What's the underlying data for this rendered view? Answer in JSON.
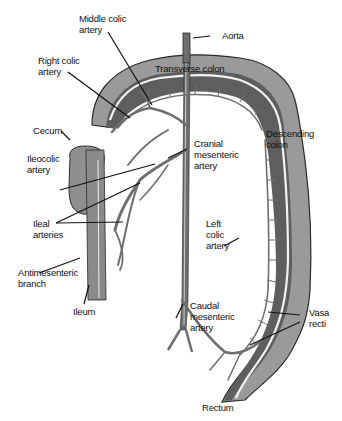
{
  "diagram": {
    "labels": {
      "middle_colic_artery": [
        "Middle colic",
        "artery"
      ],
      "aorta": "Aorta",
      "right_colic_artery": [
        "Right colic",
        "artery"
      ],
      "transverse_colon": "Transverse colon",
      "cecum": "Cecum",
      "descending_colon": [
        "Descending",
        "colon"
      ],
      "ileocolic_artery": [
        "Ileocolic",
        "artery"
      ],
      "cranial_mesenteric_artery": [
        "Cranial",
        "mesenteric",
        "artery"
      ],
      "ileal_arteries": [
        "Ileal",
        "arteries"
      ],
      "left_colic_artery": [
        "Left",
        "colic",
        "artery"
      ],
      "antimesenteric_branch": [
        "Antimesenteric",
        "branch"
      ],
      "ileum": "Ileum",
      "caudal_mesenteric_artery": [
        "Caudal",
        "mesenteric",
        "artery"
      ],
      "vasa_recti": [
        "Vasa",
        "recti"
      ],
      "rectum": "Rectum"
    },
    "colors": {
      "colon_outer": "#9a9a9a",
      "colon_inner": "#5e5e5e",
      "colon_stripe": "#f2f2f2",
      "artery": "#6e6e6e",
      "outline": "#2a2a2a",
      "leader_line": "#111111",
      "cecum": "#8f8f8f"
    }
  }
}
